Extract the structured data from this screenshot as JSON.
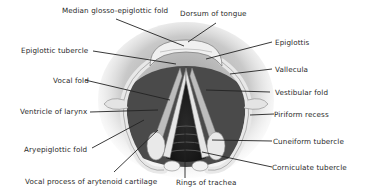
{
  "figure": {
    "labels": {
      "median_glosso_epiglottic_fold": "Median glosso-epiglottic fold",
      "dorsum_of_tongue": "Dorsum of tongue",
      "epiglottic_tubercle": "Epiglottic tubercle",
      "epiglottis": "Epiglottis",
      "vallecula": "Vallecula",
      "vocal_fold": "Vocal fold",
      "vestibular_fold": "Vestibular fold",
      "ventricle_of_larynx": "Ventricle of larynx",
      "piriform_recess": "Piriform recess",
      "aryepiglottic_fold": "Aryepiglottic fold",
      "cuneiform_tubercle": "Cuneiform tubercle",
      "corniculate_tubercle": "Corniculate tubercle",
      "vocal_process": "Vocal process of arytenoid cartilage",
      "rings_of_trachea": "Rings of trachea"
    }
  }
}
